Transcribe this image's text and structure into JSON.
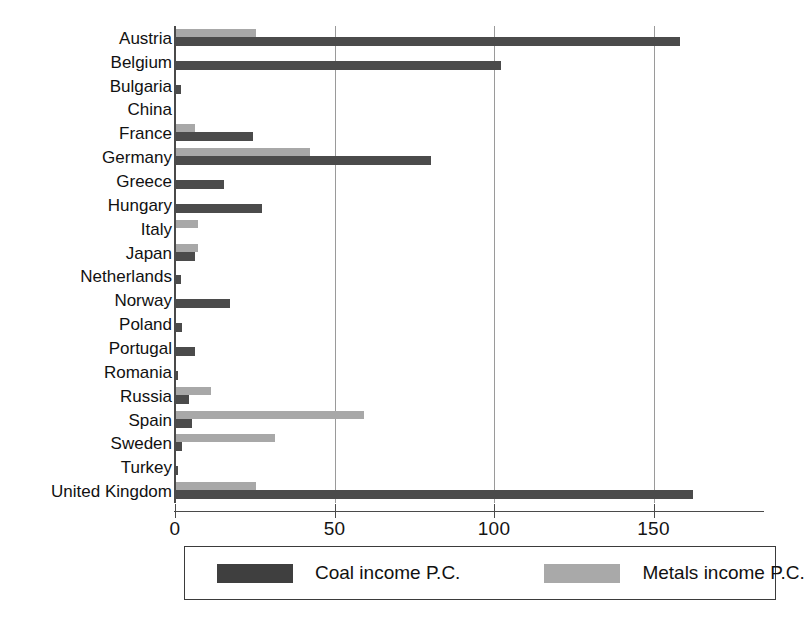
{
  "chart_data": {
    "type": "bar",
    "orientation": "horizontal",
    "title": "",
    "xlabel": "",
    "ylabel": "",
    "xlim": [
      0,
      185
    ],
    "grid": true,
    "xticks": [
      0,
      50,
      100,
      150
    ],
    "xtick_labels": [
      "0",
      "50",
      "100",
      "150"
    ],
    "legend_position": "bottom",
    "categories": [
      "Austria",
      "Belgium",
      "Bulgaria",
      "China",
      "France",
      "Germany",
      "Greece",
      "Hungary",
      "Italy",
      "Japan",
      "Netherlands",
      "Norway",
      "Poland",
      "Portugal",
      "Romania",
      "Russia",
      "Spain",
      "Sweden",
      "Turkey",
      "United Kingdom"
    ],
    "series": [
      {
        "name": "Coal income P.C.",
        "color": "#4b4b4b",
        "values": [
          158,
          102,
          1.5,
          0,
          24,
          80,
          15,
          27,
          0,
          6,
          1.5,
          17,
          2,
          6,
          0.5,
          4,
          5,
          2,
          0.5,
          162
        ]
      },
      {
        "name": "Metals income P.C.",
        "color": "#a8a8a8",
        "values": [
          25,
          0,
          0,
          0,
          6,
          42,
          0,
          0,
          7,
          7,
          0,
          0,
          0,
          0,
          0,
          11,
          59,
          31,
          0,
          25
        ]
      }
    ]
  },
  "legend": {
    "items": [
      {
        "label": "Coal income P.C.",
        "swatch": "coal-swatch"
      },
      {
        "label": "Metals income P.C.",
        "swatch": "metals-swatch"
      }
    ]
  }
}
